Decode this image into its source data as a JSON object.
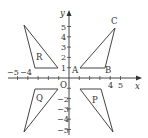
{
  "diagram": {
    "title": "",
    "colors": {
      "line": "#444444",
      "text": "#333333",
      "background": "#ffffff"
    },
    "axes": {
      "x_label": "x",
      "y_label": "y",
      "origin_label": "O",
      "x_ticks": [
        {
          "value": -5,
          "label": "−5"
        },
        {
          "value": -4,
          "label": "−4"
        },
        {
          "value": -3,
          "label": ""
        },
        {
          "value": -2,
          "label": ""
        },
        {
          "value": -1,
          "label": ""
        },
        {
          "value": 1,
          "label": ""
        },
        {
          "value": 2,
          "label": ""
        },
        {
          "value": 3,
          "label": ""
        },
        {
          "value": 4,
          "label": "4"
        },
        {
          "value": 5,
          "label": "5"
        }
      ],
      "y_ticks": [
        {
          "value": 5,
          "label": "5"
        },
        {
          "value": 4,
          "label": "4"
        },
        {
          "value": 3,
          "label": "3"
        },
        {
          "value": 2,
          "label": "2"
        },
        {
          "value": 1,
          "label": "1"
        },
        {
          "value": -1,
          "label": ""
        },
        {
          "value": -2,
          "label": "−2"
        },
        {
          "value": -3,
          "label": "−3"
        },
        {
          "value": -4,
          "label": "−4"
        },
        {
          "value": -5,
          "label": "−5"
        }
      ]
    },
    "shapes": [
      {
        "name": "ABC",
        "vertices": {
          "A": [
            1,
            1
          ],
          "B": [
            3,
            1
          ],
          "C": [
            4,
            5
          ]
        },
        "vertex_labels": [
          "A",
          "B",
          "C"
        ]
      },
      {
        "name": "R",
        "label": "R",
        "vertices": [
          [
            -1,
            1
          ],
          [
            -3,
            1
          ],
          [
            -4,
            5
          ]
        ]
      },
      {
        "name": "P",
        "label": "P",
        "vertices": [
          [
            1,
            -1
          ],
          [
            3,
            -1
          ],
          [
            4,
            -5
          ]
        ]
      },
      {
        "name": "Q",
        "label": "Q",
        "vertices": [
          [
            -1,
            -1
          ],
          [
            -3,
            -1
          ],
          [
            -4,
            -5
          ]
        ]
      }
    ],
    "labels": {
      "A": "A",
      "B": "B",
      "C": "C",
      "R": "R",
      "P": "P",
      "Q": "Q"
    }
  }
}
